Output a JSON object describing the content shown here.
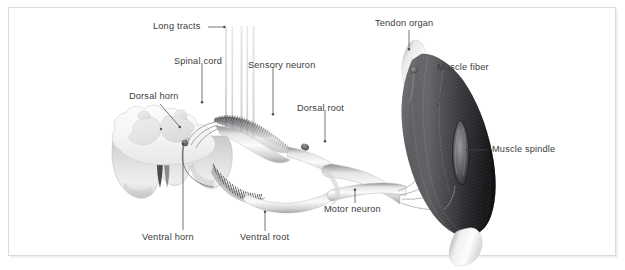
{
  "figure": {
    "background_color": "#ffffff",
    "border_color": "#dcdcdc",
    "label_color": "#3b3b3b",
    "leader_color": "#4a4a4a"
  },
  "labels": {
    "long_tracts": "Long tracts",
    "spinal_cord": "Spinal cord",
    "dorsal_horn": "Dorsal horn",
    "sensory_neuron": "Sensory neuron",
    "dorsal_root": "Dorsal root",
    "tendon_organ": "Tendon organ",
    "muscle_fiber": "Muscle fiber",
    "muscle_spindle": "Muscle spindle",
    "motor_neuron": "Motor neuron",
    "ventral_root": "Ventral root",
    "ventral_horn": "Ventral horn"
  },
  "structures": {
    "spinal_cord_name": "spinal-cord-cross-section",
    "gray_matter_name": "gray-matter-butterfly",
    "muscle_name": "skeletal-muscle",
    "tendon_upper_name": "upper-tendon",
    "tendon_lower_name": "lower-tendon",
    "spindle_name": "muscle-spindle-organ",
    "tendon_organ_name": "golgi-tendon-organ",
    "nerve_name": "spinal-nerve",
    "dorsal_root_name": "dorsal-root-bundle",
    "ventral_root_name": "ventral-root-bundle",
    "ganglion_name": "dorsal-root-ganglion",
    "motor_soma_name": "motor-neuron-cell-body",
    "long_tract_name": "long-tract-fiber"
  }
}
